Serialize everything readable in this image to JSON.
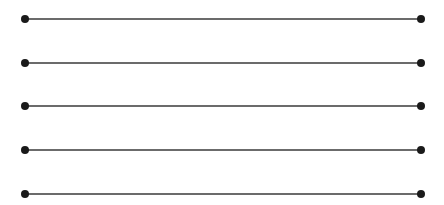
{
  "diagram": {
    "line_color": "#3a3a3a",
    "dot_color": "#1a1a1a",
    "x_start": 25,
    "x_end": 421,
    "dot_radius": 4,
    "line_width": 1.3,
    "rows": [
      {
        "y": 19
      },
      {
        "y": 63
      },
      {
        "y": 106
      },
      {
        "y": 150
      },
      {
        "y": 194
      }
    ]
  }
}
